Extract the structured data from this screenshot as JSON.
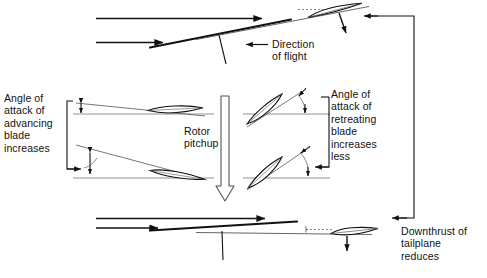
{
  "diagram": {
    "stroke_color": "#111111",
    "thin_color": "#555555",
    "background": "#ffffff"
  },
  "labels": {
    "advancing": "Angle of\nattack of\nadvancing\nblade\nincreases",
    "retreating": "Angle of\nattack of\nretreating\nblade\nincreases\nless",
    "rotor_pitchup": "Rotor\npitchup",
    "direction_of_flight": "Direction\nof flight",
    "downthrust": "Downthrust of\ntailplane\nreduces"
  },
  "elements": {
    "top_aircraft": "nose-up helicopter with tailplane and rotor mast",
    "bottom_aircraft": "level helicopter with tailplane and rotor mast",
    "advancing_blade_top": "near-horizontal airfoil, small angle of attack",
    "advancing_blade_bottom": "tilted airfoil, increased angle of attack",
    "retreating_blade_top": "steeply tilted airfoil",
    "retreating_blade_bottom": "steeply tilted airfoil",
    "pitchup_arrow": "large hollow downward arrow",
    "feedback_line": "right-hand vertical line linking bottom to top"
  }
}
